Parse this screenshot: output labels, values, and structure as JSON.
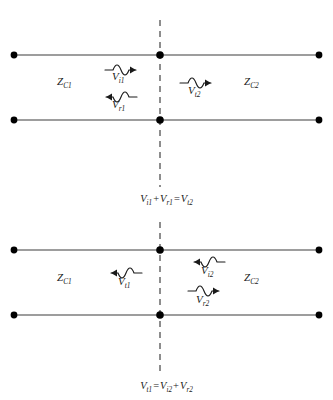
{
  "diagram": {
    "type": "circuit-wave-diagram",
    "colors": {
      "line": "#3c3c3c",
      "node": "#000000",
      "dashed_boundary": "#4a4a4a",
      "text": "#1a1a1a",
      "background": "#ffffff"
    },
    "panels": [
      {
        "id": "top",
        "name": "wave-incident-from-left",
        "impedance_left": {
          "symbol": "Z",
          "sub": "C1",
          "text": "ZC1"
        },
        "impedance_right": {
          "symbol": "Z",
          "sub": "C2",
          "text": "ZC2"
        },
        "waves": [
          {
            "name": "incident-wave-left",
            "symbol": "V",
            "sub": "i1",
            "direction": "right",
            "side": "left"
          },
          {
            "name": "reflected-wave-left",
            "symbol": "V",
            "sub": "r1",
            "direction": "left",
            "side": "left"
          },
          {
            "name": "transmitted-wave-right",
            "symbol": "V",
            "sub": "t2",
            "direction": "right",
            "side": "right"
          }
        ],
        "equation": {
          "name": "boundary-equation-top",
          "terms": [
            {
              "symbol": "V",
              "sub": "i1"
            },
            {
              "symbol": "V",
              "sub": "r1"
            },
            {
              "symbol": "V",
              "sub": "t2"
            }
          ],
          "operators": [
            "+",
            "="
          ],
          "text": "Vi1 + Vr1 = Vt2"
        }
      },
      {
        "id": "bottom",
        "name": "wave-incident-from-right",
        "impedance_left": {
          "symbol": "Z",
          "sub": "C1",
          "text": "ZC1"
        },
        "impedance_right": {
          "symbol": "Z",
          "sub": "C2",
          "text": "ZC2"
        },
        "waves": [
          {
            "name": "transmitted-wave-left",
            "symbol": "V",
            "sub": "t1",
            "direction": "left",
            "side": "left"
          },
          {
            "name": "incident-wave-right",
            "symbol": "V",
            "sub": "i2",
            "direction": "left",
            "side": "right"
          },
          {
            "name": "reflected-wave-right",
            "symbol": "V",
            "sub": "r2",
            "direction": "right",
            "side": "right"
          }
        ],
        "equation": {
          "name": "boundary-equation-bottom",
          "terms": [
            {
              "symbol": "V",
              "sub": "t1"
            },
            {
              "symbol": "V",
              "sub": "i2"
            },
            {
              "symbol": "V",
              "sub": "r2"
            }
          ],
          "operators": [
            "=",
            "+"
          ],
          "text": "Vt1 = Vi2 + Vr2"
        }
      }
    ]
  }
}
